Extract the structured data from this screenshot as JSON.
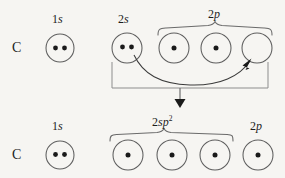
{
  "figure": {
    "background_color": "#f6f5f2",
    "ink_color": "#1d1d1d",
    "orbital_stroke_color": "#5e5e5e"
  },
  "rows": [
    {
      "id": "ground-state",
      "atom_label": "C",
      "atom_label_x": 16,
      "atom_label_y": 42,
      "groups": [
        {
          "id": "1s",
          "label_text": "1s",
          "label_number": "2",
          "label_html_number": "1",
          "label_italic": "s",
          "label_x": 52,
          "label_y": 14,
          "brace": null,
          "orbitals": [
            {
              "cx": 60,
              "cy": 48,
              "r": 14,
              "electrons": 2
            }
          ]
        },
        {
          "id": "2s",
          "label_html_number": "2",
          "label_italic": "s",
          "label_x": 118,
          "label_y": 14,
          "brace": null,
          "orbitals": [
            {
              "cx": 127,
              "cy": 48,
              "r": 15,
              "electrons": 2
            }
          ]
        },
        {
          "id": "2p",
          "label_html_number": "2",
          "label_italic": "p",
          "label_x": 208,
          "label_y": 10,
          "brace": {
            "x1": 158,
            "x2": 272,
            "y": 28,
            "depth": 7
          },
          "orbitals": [
            {
              "cx": 174,
              "cy": 48,
              "r": 15,
              "electrons": 1
            },
            {
              "cx": 216,
              "cy": 48,
              "r": 15,
              "electrons": 1
            },
            {
              "cx": 257,
              "cy": 48,
              "r": 15,
              "electrons": 0
            }
          ]
        }
      ]
    },
    {
      "id": "hybridized-state",
      "atom_label": "C",
      "atom_label_x": 16,
      "atom_label_y": 149,
      "groups": [
        {
          "id": "1s-hybrid",
          "label_html_number": "1",
          "label_italic": "s",
          "label_x": 52,
          "label_y": 121,
          "brace": null,
          "orbitals": [
            {
              "cx": 60,
              "cy": 155,
              "r": 14,
              "electrons": 2
            }
          ]
        },
        {
          "id": "2sp2",
          "label_html_number": "2",
          "label_italic": "sp",
          "label_sup": "2",
          "label_x": 157,
          "label_y": 117,
          "brace": {
            "x1": 110,
            "x2": 233,
            "y": 135,
            "depth": 7
          },
          "orbitals": [
            {
              "cx": 128,
              "cy": 155,
              "r": 15,
              "electrons": 1
            },
            {
              "cx": 172,
              "cy": 155,
              "r": 15,
              "electrons": 1
            },
            {
              "cx": 215,
              "cy": 155,
              "r": 15,
              "electrons": 1
            }
          ]
        },
        {
          "id": "2p-remaining",
          "label_html_number": "2",
          "label_italic": "p",
          "label_x": 250,
          "label_y": 121,
          "brace": null,
          "orbitals": [
            {
              "cx": 258,
              "cy": 155,
              "r": 15,
              "electrons": 1
            }
          ]
        }
      ]
    }
  ],
  "annotations": {
    "promotion_arrow": {
      "name": "electron-promotion-arrow",
      "from_orbital": "2s",
      "to_orbital": "2p-empty",
      "path": "M 135 56 C 150 84, 215 88, 248 62",
      "head": "M 248 62 L 240 72 L 252 73 Z"
    },
    "hybridization_bracket": {
      "name": "hybridization-bracket",
      "left_x": 112,
      "right_x": 268,
      "top_y": 62,
      "bottom_y": 88
    },
    "down_arrow": {
      "name": "hybridization-down-arrow",
      "x": 180,
      "y_start": 88,
      "y_end": 106
    }
  }
}
